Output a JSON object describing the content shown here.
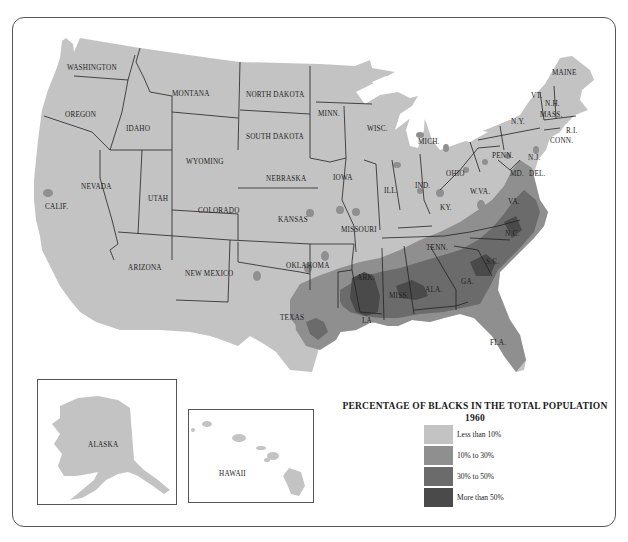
{
  "map": {
    "title": "PERCENTAGE OF BLACKS IN THE TOTAL POPULATION",
    "year": "1960",
    "colors": {
      "less_than_10": "#c3c3c3",
      "10_to_30": "#8f8f8f",
      "30_to_50": "#6b6b6b",
      "more_than_50": "#4a4a4a",
      "border": "#222222",
      "water": "#ffffff"
    },
    "legend": [
      {
        "label": "Less than 10%",
        "color": "#c3c3c3"
      },
      {
        "label": "10% to 30%",
        "color": "#8f8f8f"
      },
      {
        "label": "30% to 50%",
        "color": "#6b6b6b"
      },
      {
        "label": "More than 50%",
        "color": "#4a4a4a"
      }
    ],
    "state_labels": {
      "washington": "WASHINGTON",
      "oregon": "OREGON",
      "idaho": "IDAHO",
      "montana": "MONTANA",
      "north_dakota": "NORTH DAKOTA",
      "south_dakota": "SOUTH DAKOTA",
      "minnesota": "MINN.",
      "wisconsin": "WISC.",
      "michigan": "MICH.",
      "wyoming": "WYOMING",
      "nebraska": "NEBRASKA",
      "iowa": "IOWA",
      "illinois": "ILL.",
      "indiana": "IND.",
      "ohio": "OHIO",
      "pennsylvania": "PENN.",
      "new_york": "N.Y.",
      "vermont": "VT.",
      "new_hampshire": "N.H.",
      "maine": "MAINE",
      "massachusetts": "MASS.",
      "rhode_island": "R.I.",
      "connecticut": "CONN.",
      "new_jersey": "N.J.",
      "delaware": "DEL.",
      "maryland": "MD.",
      "west_virginia": "W.VA.",
      "virginia": "VA.",
      "kentucky": "KY.",
      "nevada": "NEVADA",
      "california": "CALIF.",
      "utah": "UTAH",
      "colorado": "COLORADO",
      "kansas": "KANSAS",
      "missouri": "MISSOURI",
      "arizona": "ARIZONA",
      "new_mexico": "NEW MEXICO",
      "oklahoma": "OKLAHOMA",
      "arkansas": "ARK.",
      "tennessee": "TENN.",
      "north_carolina": "N.C.",
      "south_carolina": "S.C.",
      "georgia": "GA.",
      "alabama": "ALA.",
      "mississippi": "MISS.",
      "louisiana": "LA.",
      "texas": "TEXAS",
      "florida": "FLA.",
      "alaska": "ALASKA",
      "hawaii": "HAWAII"
    }
  }
}
